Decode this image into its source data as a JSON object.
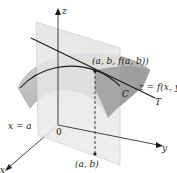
{
  "diagram": {
    "axes": {
      "z_label": "z",
      "y_label": "y",
      "x_label": "x",
      "origin_label": "0"
    },
    "labels": {
      "point": "(a, b, f(a, b))",
      "surface": "z = f(x, y)",
      "curve": "C",
      "tangent": "T",
      "plane": "x = a",
      "base_point": "(a, b)"
    },
    "colors": {
      "plane": "#d9d9d9",
      "surface": "#a8a8a8",
      "surface_light": "#cfcfcf",
      "lines": "#1a1a1a"
    }
  }
}
